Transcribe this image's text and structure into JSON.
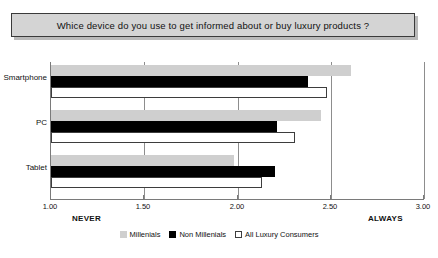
{
  "title": {
    "text": "Whice device do you use to get informed about or buy luxury products ?"
  },
  "axis": {
    "tick_labels": [
      "1.00",
      "1.50",
      "2.00",
      "2.50",
      "3.00"
    ],
    "anchor_low": "NEVER",
    "anchor_high": "ALWAYS"
  },
  "legend": {
    "items": [
      {
        "label": "Millenials",
        "color": "#cfcfcf"
      },
      {
        "label": "Non Millenials",
        "color": "#000000"
      },
      {
        "label": "All Luxury Consumers",
        "color": "#ffffff"
      }
    ]
  },
  "chart_data": {
    "type": "bar",
    "orientation": "horizontal",
    "title": "Whice device do you use to get informed about or buy luxury products ?",
    "xlabel": "",
    "ylabel": "",
    "xlim": [
      1.0,
      3.0
    ],
    "xticks": [
      1.0,
      1.5,
      2.0,
      2.5,
      3.0
    ],
    "xtick_labels": [
      "1.00",
      "1.50",
      "2.00",
      "2.50",
      "3.00"
    ],
    "x_anchor_low": "NEVER",
    "x_anchor_high": "ALWAYS",
    "grid": true,
    "legend_position": "bottom",
    "categories": [
      "Smartphone",
      "PC",
      "Tablet"
    ],
    "series": [
      {
        "name": "Millenials",
        "color": "#cfcfcf",
        "values": [
          2.61,
          2.45,
          1.98
        ]
      },
      {
        "name": "Non Millenials",
        "color": "#000000",
        "values": [
          2.38,
          2.21,
          2.2
        ]
      },
      {
        "name": "All Luxury Consumers",
        "color": "#ffffff",
        "values": [
          2.48,
          2.31,
          2.13
        ]
      }
    ]
  }
}
